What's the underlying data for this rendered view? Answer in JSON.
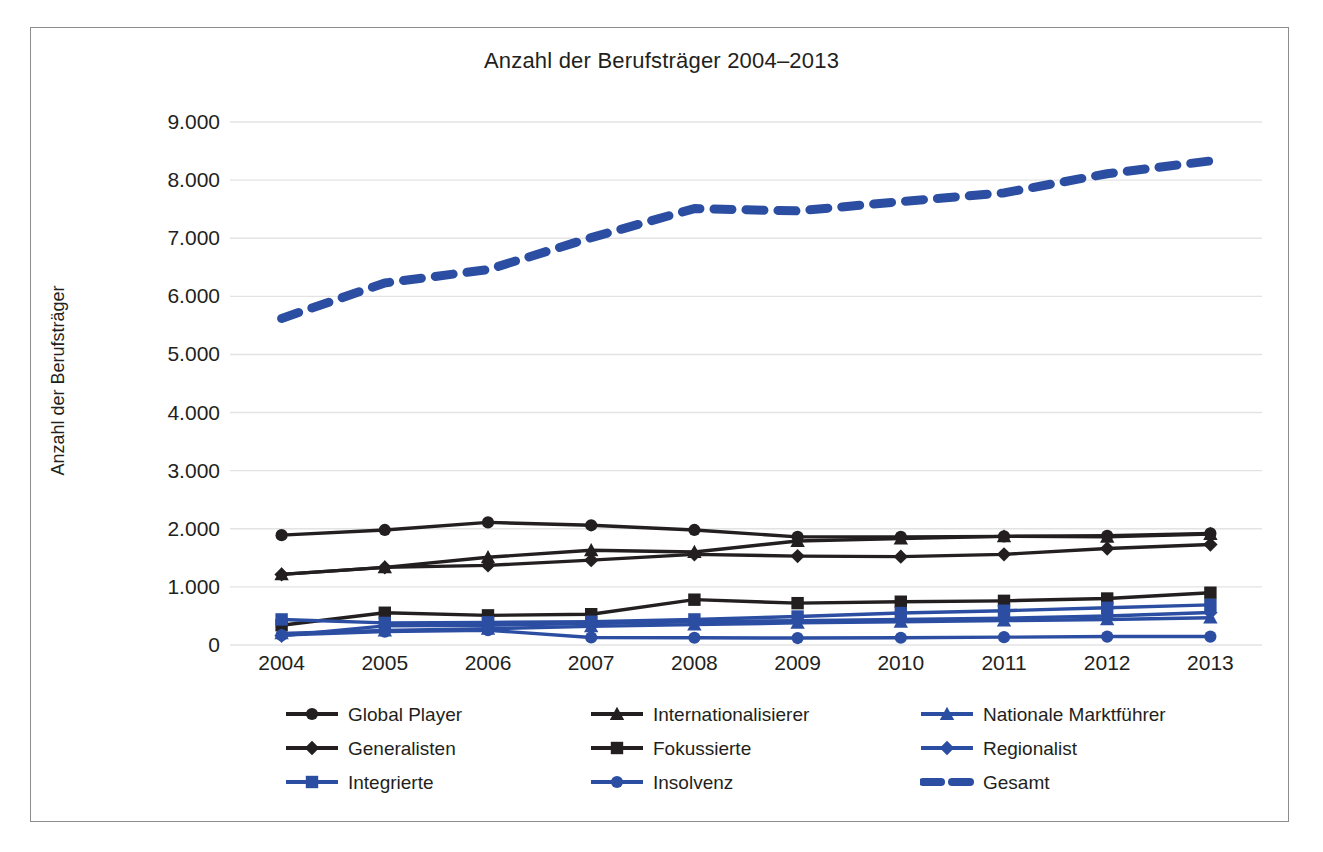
{
  "chart_data": {
    "type": "line",
    "title": "Anzahl der Berufsträger 2004–2013",
    "xlabel": "",
    "ylabel": "Anzahl der Berufsträger",
    "categories": [
      "2004",
      "2005",
      "2006",
      "2007",
      "2008",
      "2009",
      "2010",
      "2011",
      "2012",
      "2013"
    ],
    "x": [
      2004,
      2005,
      2006,
      2007,
      2008,
      2009,
      2010,
      2011,
      2012,
      2013
    ],
    "ylim": [
      0,
      9000
    ],
    "yticks": [
      0,
      1000,
      2000,
      3000,
      4000,
      5000,
      6000,
      7000,
      8000,
      9000
    ],
    "ytick_labels": [
      "0",
      "1.000",
      "2.000",
      "3.000",
      "4.000",
      "5.000",
      "6.000",
      "7.000",
      "8.000",
      "9.000"
    ],
    "grid": true,
    "legend_position": "bottom",
    "series": [
      {
        "name": "Global Player",
        "color": "#231f20",
        "marker": "circle",
        "dash": false,
        "values": [
          1890,
          1980,
          2110,
          2060,
          1980,
          1860,
          1860,
          1870,
          1880,
          1920
        ]
      },
      {
        "name": "Internationalisierer",
        "color": "#231f20",
        "marker": "triangle",
        "dash": false,
        "values": [
          1215,
          1335,
          1510,
          1630,
          1600,
          1790,
          1830,
          1870,
          1860,
          1910
        ]
      },
      {
        "name": "Nationale Marktführer",
        "color": "#2b4ea2",
        "marker": "triangle",
        "dash": false,
        "values": [
          200,
          250,
          280,
          320,
          350,
          380,
          400,
          420,
          440,
          470
        ]
      },
      {
        "name": "Generalisten",
        "color": "#231f20",
        "marker": "diamond",
        "dash": false,
        "values": [
          1215,
          1335,
          1370,
          1460,
          1560,
          1530,
          1520,
          1560,
          1660,
          1730
        ]
      },
      {
        "name": "Fokussierte",
        "color": "#231f20",
        "marker": "square",
        "dash": false,
        "values": [
          340,
          555,
          510,
          530,
          780,
          720,
          745,
          760,
          800,
          900
        ]
      },
      {
        "name": "Regionalist",
        "color": "#2b4ea2",
        "marker": "diamond",
        "dash": false,
        "values": [
          160,
          330,
          340,
          370,
          400,
          420,
          440,
          460,
          500,
          560
        ]
      },
      {
        "name": "Integrierte",
        "color": "#2b4ea2",
        "marker": "square",
        "dash": false,
        "values": [
          440,
          380,
          390,
          400,
          440,
          490,
          550,
          590,
          640,
          690
        ]
      },
      {
        "name": "Insolvenz",
        "color": "#2b4ea2",
        "marker": "circle",
        "dash": false,
        "values": [
          170,
          230,
          255,
          130,
          125,
          120,
          125,
          135,
          145,
          145
        ]
      },
      {
        "name": "Gesamt",
        "color": "#2b4ea2",
        "marker": "none",
        "dash": true,
        "values": [
          5620,
          6230,
          6460,
          7010,
          7510,
          7470,
          7630,
          7780,
          8110,
          8330
        ]
      }
    ]
  },
  "legend": {
    "items": [
      {
        "label": "Global Player",
        "color": "#231f20",
        "marker": "circle",
        "dash": false
      },
      {
        "label": "Internationalisierer",
        "color": "#231f20",
        "marker": "triangle",
        "dash": false
      },
      {
        "label": "Nationale Marktführer",
        "color": "#2b4ea2",
        "marker": "triangle",
        "dash": false
      },
      {
        "label": "Generalisten",
        "color": "#231f20",
        "marker": "diamond",
        "dash": false
      },
      {
        "label": "Fokussierte",
        "color": "#231f20",
        "marker": "square",
        "dash": false
      },
      {
        "label": "Regionalist",
        "color": "#2b4ea2",
        "marker": "diamond",
        "dash": false
      },
      {
        "label": "Integrierte",
        "color": "#2b4ea2",
        "marker": "square",
        "dash": false
      },
      {
        "label": "Insolvenz",
        "color": "#2b4ea2",
        "marker": "circle",
        "dash": false
      },
      {
        "label": "Gesamt",
        "color": "#2b4ea2",
        "marker": "none",
        "dash": true
      }
    ]
  },
  "colors": {
    "blue": "#2b4ea2",
    "black": "#231f20",
    "gridline": "#e3e3e3",
    "frame": "#8d8d8d"
  }
}
